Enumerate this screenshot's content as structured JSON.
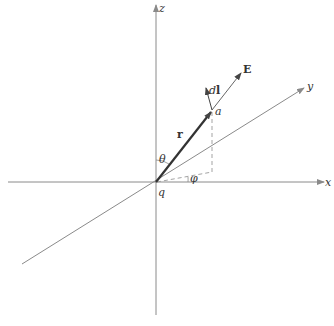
{
  "diagram": {
    "type": "3d-coordinate-vector-diagram",
    "colors": {
      "axis": "#8a8a8a",
      "vector": "#333333",
      "dashed": "#999999",
      "text": "#333333"
    },
    "axes": {
      "x_label": "x",
      "y_label": "y",
      "z_label": "z"
    },
    "points": {
      "origin_label": "q",
      "point_label": "a"
    },
    "vectors": {
      "position_label": "r",
      "field_label": "E",
      "line_element_label": "dl",
      "line_element_prefix": "d",
      "line_element_suffix": "l"
    },
    "angles": {
      "polar_label": "θ",
      "azimuthal_label": "φ"
    }
  }
}
